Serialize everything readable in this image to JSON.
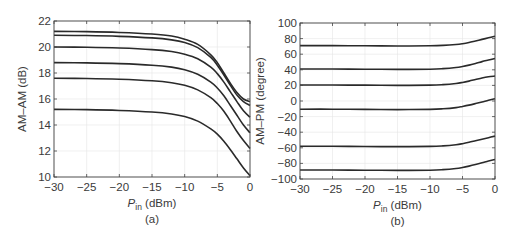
{
  "chart_data": [
    {
      "type": "line",
      "panel": "(a)",
      "title": "",
      "xlabel": "P_in (dBm)",
      "xlabel_main": "P",
      "xlabel_sub": "in",
      "xlabel_rest": " (dBm)",
      "ylabel": "AM–AM (dB)",
      "xlim": [
        -30,
        0
      ],
      "ylim": [
        10,
        22
      ],
      "xticks": [
        -30,
        -25,
        -20,
        -15,
        -10,
        -5,
        0
      ],
      "xtick_labels": [
        "−30",
        "−25",
        "−20",
        "−15",
        "−10",
        "−5",
        "0"
      ],
      "yticks": [
        10,
        12,
        14,
        16,
        18,
        20,
        22
      ],
      "ytick_labels": [
        "10",
        "12",
        "14",
        "16",
        "18",
        "20",
        "22"
      ],
      "grid": true,
      "legend": null,
      "x": [
        -30,
        -25,
        -20,
        -15,
        -12,
        -10,
        -8,
        -6,
        -5,
        -4,
        -3,
        -2,
        -1,
        0
      ],
      "series": [
        {
          "name": "curve 1",
          "values": [
            21.2,
            21.18,
            21.12,
            21.0,
            20.85,
            20.6,
            20.2,
            19.4,
            18.8,
            18.0,
            17.2,
            16.5,
            16.0,
            15.8
          ]
        },
        {
          "name": "curve 2",
          "values": [
            20.9,
            20.88,
            20.82,
            20.7,
            20.55,
            20.35,
            19.95,
            19.2,
            18.6,
            17.85,
            17.05,
            16.3,
            15.8,
            15.5
          ]
        },
        {
          "name": "curve 3",
          "values": [
            20.0,
            19.98,
            19.92,
            19.8,
            19.65,
            19.45,
            19.1,
            18.45,
            17.95,
            17.3,
            16.55,
            15.8,
            15.1,
            14.6
          ]
        },
        {
          "name": "curve 4",
          "values": [
            18.8,
            18.78,
            18.72,
            18.6,
            18.45,
            18.25,
            17.9,
            17.3,
            16.85,
            16.25,
            15.5,
            14.75,
            14.0,
            13.4
          ]
        },
        {
          "name": "curve 5",
          "values": [
            17.6,
            17.58,
            17.52,
            17.4,
            17.25,
            17.05,
            16.7,
            16.1,
            15.65,
            15.05,
            14.3,
            13.5,
            12.8,
            12.2
          ]
        },
        {
          "name": "curve 6",
          "values": [
            15.2,
            15.18,
            15.12,
            15.0,
            14.85,
            14.65,
            14.3,
            13.7,
            13.3,
            12.75,
            12.1,
            11.4,
            10.7,
            10.1
          ]
        }
      ],
      "caption": "(a)"
    },
    {
      "type": "line",
      "panel": "(b)",
      "title": "",
      "xlabel": "P_in (dBm)",
      "xlabel_main": "P",
      "xlabel_sub": "in",
      "xlabel_rest": " (dBm)",
      "ylabel": "AM–PM (degree)",
      "xlim": [
        -30,
        0
      ],
      "ylim": [
        -100,
        100
      ],
      "xticks": [
        -30,
        -25,
        -20,
        -15,
        -10,
        -5,
        0
      ],
      "xtick_labels": [
        "−30",
        "−25",
        "−20",
        "−15",
        "−10",
        "−5",
        "0"
      ],
      "yticks": [
        -100,
        -80,
        -60,
        -40,
        -20,
        0,
        20,
        40,
        60,
        80,
        100
      ],
      "ytick_labels": [
        "−100",
        "−80",
        "−60",
        "−40",
        "−20",
        "0",
        "20",
        "40",
        "60",
        "80",
        "100"
      ],
      "grid": true,
      "legend": null,
      "x": [
        -30,
        -25,
        -20,
        -15,
        -10,
        -8,
        -6,
        -5,
        -4,
        -3,
        -2,
        -1,
        0
      ],
      "series": [
        {
          "name": "curve 1",
          "values": [
            71,
            71,
            70.8,
            70.5,
            70.8,
            71.3,
            72.5,
            73.5,
            75,
            77,
            79,
            81,
            83
          ]
        },
        {
          "name": "curve 2",
          "values": [
            41,
            41,
            40.8,
            40.5,
            40.8,
            41.5,
            43,
            44.3,
            46,
            48,
            50.5,
            52.5,
            54.5
          ]
        },
        {
          "name": "curve 3",
          "values": [
            20.5,
            20.5,
            20.3,
            20,
            20.3,
            21,
            22.5,
            23.8,
            25.5,
            27.5,
            29.5,
            31,
            32
          ]
        },
        {
          "name": "curve 4",
          "values": [
            -10.5,
            -10.5,
            -10.8,
            -11,
            -10.7,
            -10,
            -8.5,
            -7,
            -5.3,
            -3.3,
            -1.2,
            1,
            3
          ]
        },
        {
          "name": "curve 5",
          "values": [
            -58,
            -58,
            -58.3,
            -58.5,
            -58.2,
            -57.5,
            -56,
            -54.7,
            -53,
            -51,
            -49,
            -47,
            -45
          ]
        },
        {
          "name": "curve 6",
          "values": [
            -88.5,
            -88.5,
            -88.7,
            -89,
            -88.7,
            -88,
            -86.5,
            -85.2,
            -83.5,
            -81.5,
            -79.3,
            -77,
            -75
          ]
        }
      ],
      "caption": "(b)"
    }
  ],
  "layout": {
    "panels": [
      {
        "left": 54,
        "right": 250,
        "top": 21,
        "bottom": 177
      },
      {
        "left": 300,
        "right": 495,
        "top": 23,
        "bottom": 179
      }
    ]
  }
}
